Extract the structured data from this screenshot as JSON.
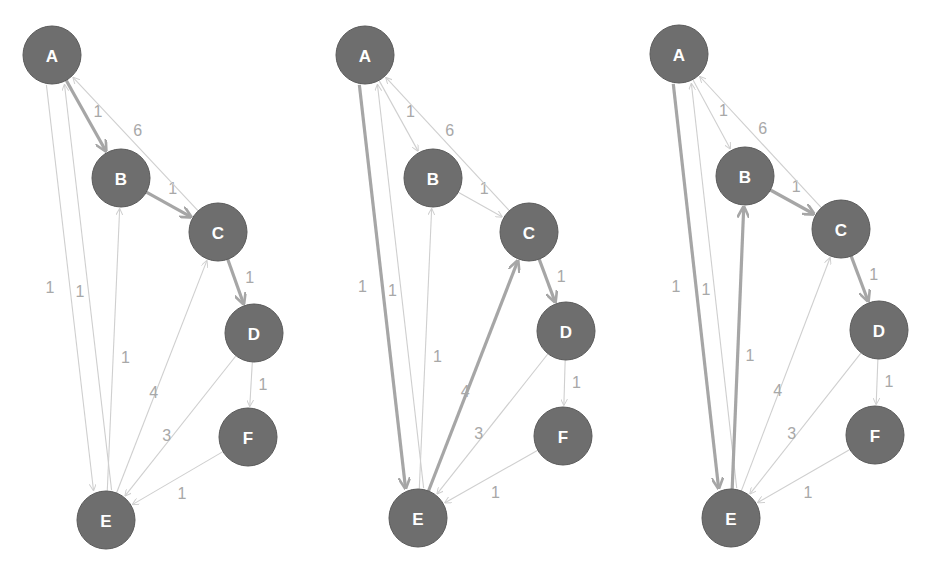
{
  "colors": {
    "node_fill": "#6e6e6e",
    "node_label": "#ffffff",
    "edge_normal": "#cfcfcf",
    "edge_highlight": "#a6a6a6",
    "edge_label": "#a8a8a8",
    "background": "#ffffff"
  },
  "nodes": [
    "A",
    "B",
    "C",
    "D",
    "E",
    "F"
  ],
  "edges": [
    {
      "from": "A",
      "to": "B",
      "weight": "1"
    },
    {
      "from": "B",
      "to": "C",
      "weight": "1"
    },
    {
      "from": "C",
      "to": "A",
      "weight": "6"
    },
    {
      "from": "C",
      "to": "D",
      "weight": "1"
    },
    {
      "from": "D",
      "to": "F",
      "weight": "1"
    },
    {
      "from": "D",
      "to": "E",
      "weight": "3"
    },
    {
      "from": "F",
      "to": "E",
      "weight": "1"
    },
    {
      "from": "A",
      "to": "E",
      "weight": "1"
    },
    {
      "from": "E",
      "to": "A",
      "weight": "1"
    },
    {
      "from": "E",
      "to": "B",
      "weight": "1"
    },
    {
      "from": "E",
      "to": "C",
      "weight": "4"
    }
  ],
  "graphs": [
    {
      "name": "graph-1",
      "positions": {
        "A": [
          52,
          55
        ],
        "B": [
          121,
          178
        ],
        "C": [
          218,
          232
        ],
        "D": [
          254,
          333
        ],
        "E": [
          106,
          520
        ],
        "F": [
          248,
          437
        ]
      },
      "highlighted_path": [
        "A-B",
        "B-C",
        "C-D"
      ]
    },
    {
      "name": "graph-2",
      "positions": {
        "A": [
          365,
          55
        ],
        "B": [
          433,
          178
        ],
        "C": [
          529,
          232
        ],
        "D": [
          566,
          331
        ],
        "E": [
          418,
          518
        ],
        "F": [
          563,
          436
        ]
      },
      "highlighted_path": [
        "A-E",
        "E-C",
        "C-D"
      ]
    },
    {
      "name": "graph-3",
      "positions": {
        "A": [
          679,
          54
        ],
        "B": [
          745,
          176
        ],
        "C": [
          841,
          229
        ],
        "D": [
          879,
          330
        ],
        "E": [
          731,
          518
        ],
        "F": [
          875,
          435
        ]
      },
      "highlighted_path": [
        "A-E",
        "E-B",
        "B-C",
        "C-D"
      ]
    }
  ]
}
